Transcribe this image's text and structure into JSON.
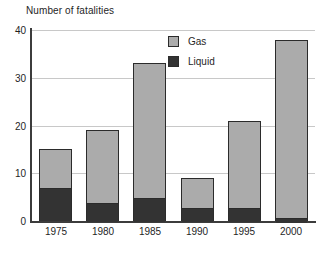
{
  "chart_data": {
    "type": "bar",
    "subtype": "stacked",
    "title": "Number of fatalities",
    "xlabel": "",
    "ylabel": "",
    "categories": [
      "1975",
      "1980",
      "1985",
      "1990",
      "1995",
      "2000"
    ],
    "series": [
      {
        "name": "Liquid",
        "color": "#333333",
        "values": [
          7,
          4,
          5,
          3,
          3,
          1
        ]
      },
      {
        "name": "Gas",
        "color": "#ababab",
        "values": [
          8,
          15,
          28,
          6,
          18,
          37
        ]
      }
    ],
    "totals": [
      15,
      19,
      33,
      9,
      21,
      38
    ],
    "ylim": [
      0,
      40
    ],
    "yticks": [
      "0",
      "10",
      "20",
      "30",
      "40"
    ],
    "ytick_values": [
      0,
      10,
      20,
      30,
      40
    ],
    "grid": true,
    "grid_axis": "y",
    "legend": {
      "position": "top-center",
      "entries": [
        {
          "label": "Gas",
          "color": "#ababab"
        },
        {
          "label": "Liquid",
          "color": "#333333"
        }
      ]
    },
    "stack_order": [
      "Liquid",
      "Gas"
    ],
    "background": "#ffffff",
    "axis_color": "#3c3c3c",
    "grid_color": "#c8c8c8"
  }
}
